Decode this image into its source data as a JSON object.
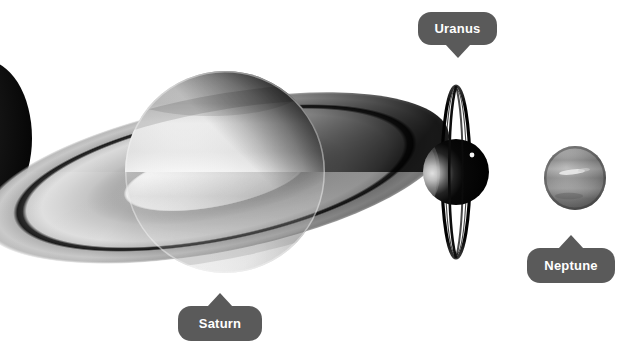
{
  "canvas": {
    "width": 632,
    "height": 361,
    "background": "#ffffff"
  },
  "theme": {
    "label_background": "#5a5a5a",
    "label_text_color": "#ffffff",
    "saturn_body": "#e8e8e8",
    "uranus_body": "#0a0a0a",
    "neptune_body": "#8e8e8e",
    "ring_light": "#c9c9c9",
    "ring_dark": "#1a1a1a"
  },
  "labels": [
    {
      "id": "uranus",
      "text": "Uranus",
      "tail": "down",
      "x": 418,
      "y": 12,
      "width": 79,
      "height": 33
    },
    {
      "id": "saturn",
      "text": "Saturn",
      "tail": "up",
      "x": 178,
      "y": 306,
      "width": 84,
      "height": 35
    },
    {
      "id": "neptune",
      "text": "Neptune",
      "tail": "up",
      "x": 527,
      "y": 248,
      "width": 88,
      "height": 35
    }
  ],
  "bodies": [
    {
      "id": "edge-body",
      "name": "dark-crescent-body",
      "cx": -16,
      "cy": 138,
      "rx": 48,
      "ry": 78,
      "tone": "dark"
    },
    {
      "id": "saturn",
      "name": "saturn-planet",
      "cx": 225,
      "cy": 172,
      "rx": 100,
      "ry": 101,
      "tone": "light",
      "has_rings": true,
      "ring_outer_rx": 238,
      "ring_outer_ry": 74
    },
    {
      "id": "uranus",
      "name": "uranus-planet",
      "cx": 456,
      "cy": 172,
      "rx": 33,
      "ry": 33,
      "tone": "dark",
      "has_rings": true,
      "ring_outer_rx": 14,
      "ring_outer_ry": 86,
      "moon": {
        "cx": 472,
        "cy": 155,
        "r": 2.4
      }
    },
    {
      "id": "neptune",
      "name": "neptune-planet",
      "cx": 575,
      "cy": 178,
      "rx": 31,
      "ry": 32,
      "tone": "mid"
    }
  ],
  "scene": {
    "title": "Outer planets grayscale montage",
    "planet_count": 4
  }
}
